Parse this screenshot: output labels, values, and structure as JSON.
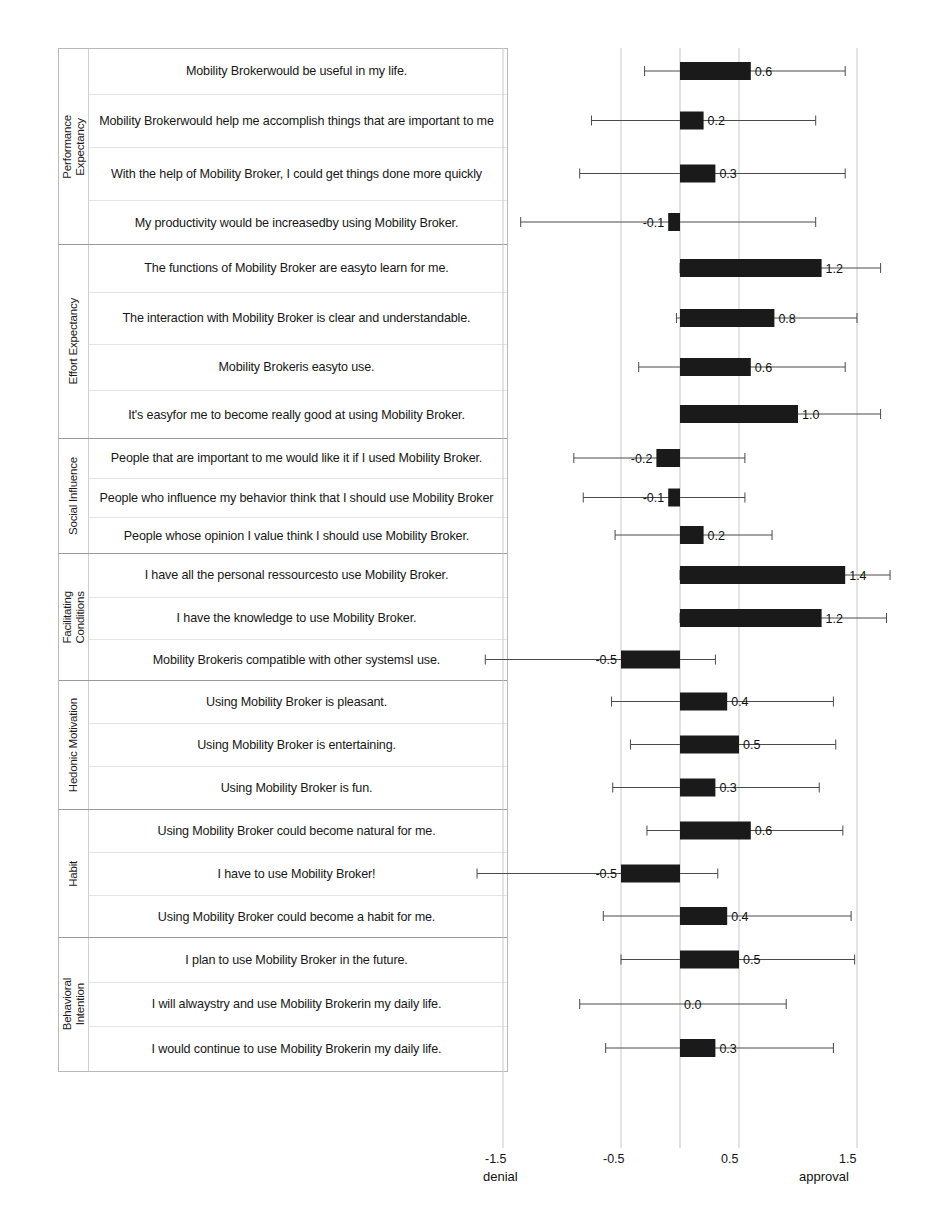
{
  "chart_data": {
    "type": "bar",
    "orientation": "horizontal",
    "title": "",
    "xlabel": "",
    "ylabel": "",
    "xlim": [
      -1.7,
      1.85
    ],
    "grid": true,
    "gridlines": [
      -1.5,
      -0.5,
      0.0,
      0.5,
      1.5
    ],
    "xticks": [
      -1.5,
      -0.5,
      0.5,
      1.5
    ],
    "xtick_labels": [
      "-1.5",
      "-0.5",
      "0.5",
      "1.5"
    ],
    "axis_anchor_left": "denial",
    "axis_anchor_right": "approval",
    "error_bar_style": "capped-whiskers",
    "bar_color": "#1a1a1a",
    "grid_color": "#c9c9c9",
    "groups": [
      {
        "label": "Performance\nExpectancy",
        "items": [
          {
            "statement": "Mobility  Brokerwould be useful in my life.",
            "value": 0.6,
            "label": "0.6",
            "err_low": -0.3,
            "err_high": 1.4
          },
          {
            "statement": "Mobility  Brokerwould help me accomplish things that are important to me",
            "value": 0.2,
            "label": "0.2",
            "err_low": -0.75,
            "err_high": 1.15
          },
          {
            "statement": "With the help of Mobility  Broker, I could get things done more quickly",
            "value": 0.3,
            "label": "0.3",
            "err_low": -0.85,
            "err_high": 1.4
          },
          {
            "statement": "My productivity  would be increasedby using Mobility  Broker.",
            "value": -0.1,
            "label": "-0.1",
            "err_low": -1.35,
            "err_high": 1.15
          }
        ]
      },
      {
        "label": "Effort Expectancy",
        "items": [
          {
            "statement": "The functions of Mobility  Broker are easyto learn for me.",
            "value": 1.2,
            "label": "1.2",
            "err_low": 0.0,
            "err_high": 1.7
          },
          {
            "statement": "The interaction with  Mobility  Broker is clear and understandable.",
            "value": 0.8,
            "label": "0.8",
            "err_low": -0.03,
            "err_high": 1.5
          },
          {
            "statement": "Mobility  Brokeris easyto use.",
            "value": 0.6,
            "label": "0.6",
            "err_low": -0.35,
            "err_high": 1.4
          },
          {
            "statement": "It's easyfor me to become really good at using Mobility  Broker.",
            "value": 1.0,
            "label": "1.0",
            "err_low": 0.02,
            "err_high": 1.7
          }
        ]
      },
      {
        "label": "Social Influence",
        "items": [
          {
            "statement": "People that are important  to me would like it if I used Mobility  Broker.",
            "value": -0.2,
            "label": "-0.2",
            "err_low": -0.9,
            "err_high": 0.55
          },
          {
            "statement": "People who influence  my behavior think that I should use Mobility  Broker",
            "value": -0.1,
            "label": "-0.1",
            "err_low": -0.82,
            "err_high": 0.55
          },
          {
            "statement": "People whose opinion  I value think  I should use Mobility  Broker.",
            "value": 0.2,
            "label": "0.2",
            "err_low": -0.55,
            "err_high": 0.78
          }
        ]
      },
      {
        "label": "Facilitating\nConditions",
        "items": [
          {
            "statement": "I have all the personal ressourcesto use Mobility  Broker.",
            "value": 1.4,
            "label": "1.4",
            "err_low": 0.0,
            "err_high": 1.78
          },
          {
            "statement": "I have the knowledge to use Mobility  Broker.",
            "value": 1.2,
            "label": "1.2",
            "err_low": 0.0,
            "err_high": 1.75
          },
          {
            "statement": "Mobility  Brokeris compatible with other systemsI use.",
            "value": -0.5,
            "label": "-0.5",
            "err_low": -1.65,
            "err_high": 0.3
          }
        ]
      },
      {
        "label": "Hedonic Motivation",
        "items": [
          {
            "statement": "Using Mobility  Broker is pleasant.",
            "value": 0.4,
            "label": "0.4",
            "err_low": -0.58,
            "err_high": 1.3
          },
          {
            "statement": "Using Mobility  Broker is entertaining.",
            "value": 0.5,
            "label": "0.5",
            "err_low": -0.42,
            "err_high": 1.32
          },
          {
            "statement": "Using Mobility  Broker is fun.",
            "value": 0.3,
            "label": "0.3",
            "err_low": -0.57,
            "err_high": 1.18
          }
        ]
      },
      {
        "label": "Habit",
        "items": [
          {
            "statement": "Using Mobility  Broker could become natural for me.",
            "value": 0.6,
            "label": "0.6",
            "err_low": -0.28,
            "err_high": 1.38
          },
          {
            "statement": "I have to use Mobility  Broker!",
            "value": -0.5,
            "label": "-0.5",
            "err_low": -1.72,
            "err_high": 0.32
          },
          {
            "statement": "Using Mobility  Broker could become a habit for  me.",
            "value": 0.4,
            "label": "0.4",
            "err_low": -0.65,
            "err_high": 1.45
          }
        ]
      },
      {
        "label": "Behavioral\nIntention",
        "items": [
          {
            "statement": "I plan to use Mobility  Broker in the future.",
            "value": 0.5,
            "label": "0.5",
            "err_low": -0.5,
            "err_high": 1.48
          },
          {
            "statement": "I will  alwaystry and use Mobility  Brokerin my daily life.",
            "value": 0.0,
            "label": "0.0",
            "err_low": -0.85,
            "err_high": 0.9
          },
          {
            "statement": "I would  continue to use Mobility  Brokerin my daily life.",
            "value": 0.3,
            "label": "0.3",
            "err_low": -0.63,
            "err_high": 1.3
          }
        ]
      }
    ]
  }
}
